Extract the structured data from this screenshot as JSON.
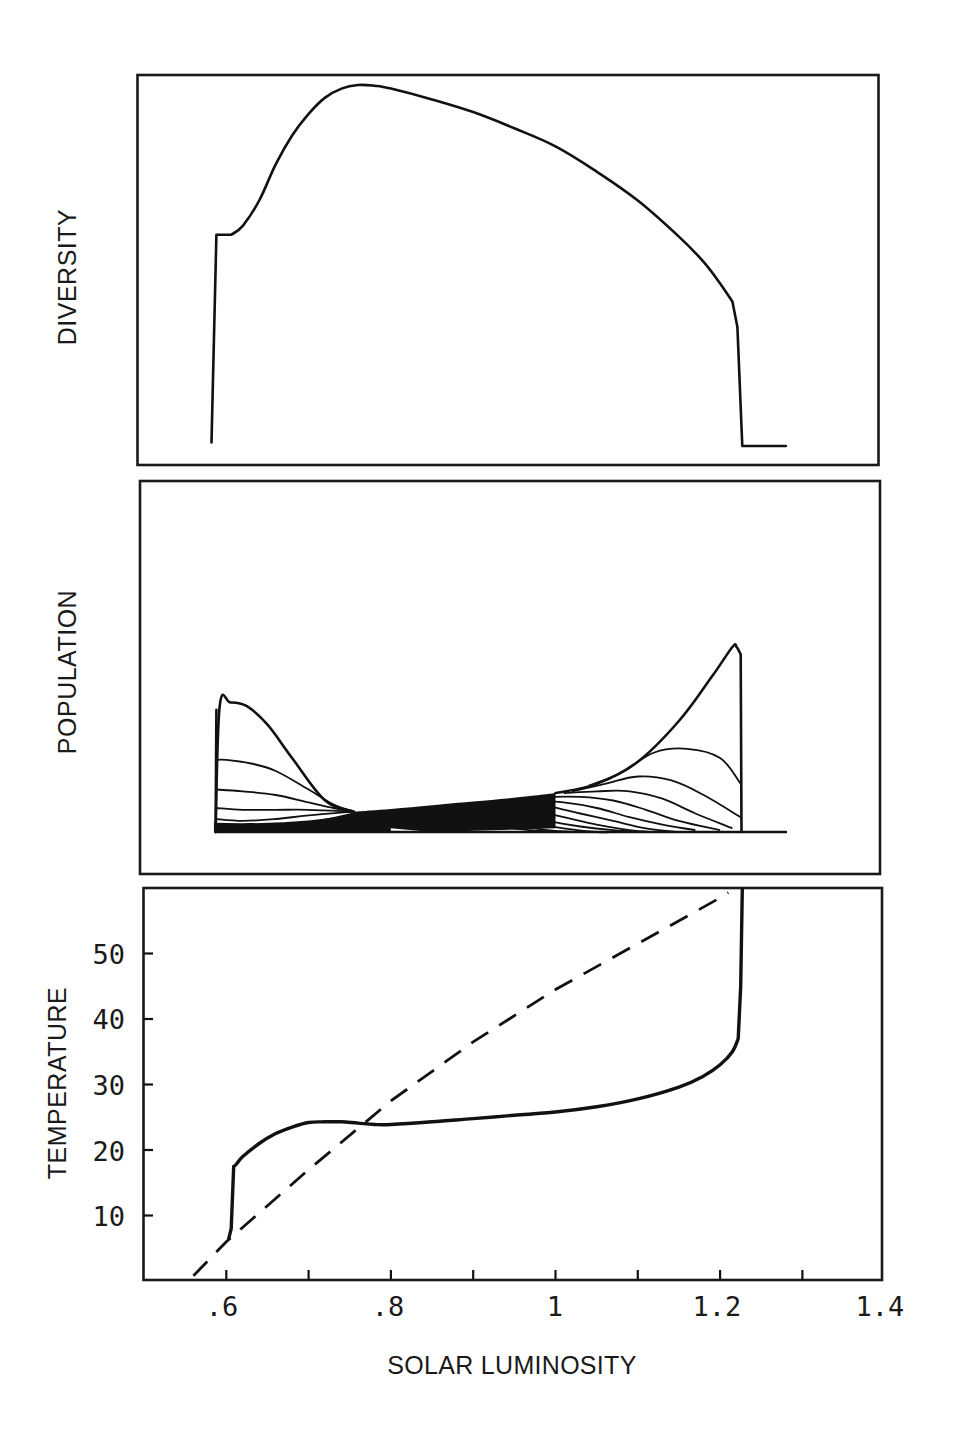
{
  "figure": {
    "panels": [
      {
        "id": "diversity",
        "ylabel": "DIVERSITY"
      },
      {
        "id": "population",
        "ylabel": "POPULATION"
      },
      {
        "id": "temperature",
        "ylabel": "TEMPERATURE"
      }
    ],
    "xlabel": "SOLAR LUMINOSITY",
    "x_tick_labels": [
      ".6",
      ".8",
      "1",
      "1.2",
      "1.4"
    ],
    "y_tick_labels": [
      "10",
      "20",
      "30",
      "40",
      "50"
    ]
  },
  "chart_data": [
    {
      "type": "line",
      "title": "",
      "xlabel": "",
      "ylabel": "DIVERSITY",
      "xlim": [
        0.5,
        1.4
      ],
      "ylim": [
        0,
        1.05
      ],
      "grid": false,
      "y_ticks": false,
      "series": [
        {
          "name": "diversity",
          "style": "solid",
          "x": [
            0.582,
            0.588,
            0.606,
            0.62,
            0.64,
            0.66,
            0.68,
            0.7,
            0.72,
            0.74,
            0.76,
            0.78,
            0.8,
            0.85,
            0.9,
            0.95,
            1.0,
            1.05,
            1.1,
            1.15,
            1.18,
            1.2,
            1.215,
            1.221,
            1.227,
            1.28
          ],
          "y": [
            0.01,
            0.585,
            0.585,
            0.61,
            0.68,
            0.78,
            0.86,
            0.92,
            0.965,
            0.99,
            1.0,
            0.998,
            0.99,
            0.96,
            0.925,
            0.88,
            0.83,
            0.76,
            0.68,
            0.58,
            0.51,
            0.45,
            0.4,
            0.33,
            0.0,
            0.0
          ]
        }
      ]
    },
    {
      "type": "line",
      "title": "",
      "xlabel": "",
      "ylabel": "POPULATION",
      "xlim": [
        0.5,
        1.4
      ],
      "ylim": [
        0,
        1.1
      ],
      "grid": false,
      "y_ticks": false,
      "note": "Family of ~20 daisy-species population curves; species adapted to cold peak at low luminosity, species adapted to warm peak at high luminosity",
      "left_family": {
        "x_start": 0.587,
        "x_converge": 0.755,
        "curves": [
          {
            "x": [
              0.587,
              0.592,
              0.605,
              0.625,
              0.65,
              0.68,
              0.72,
              0.755
            ],
            "y": [
              0.0,
              0.68,
              0.7,
              0.68,
              0.58,
              0.4,
              0.17,
              0.11
            ]
          },
          {
            "x": [
              0.587,
              0.6,
              0.63,
              0.66,
              0.7,
              0.73,
              0.755
            ],
            "y": [
              0.39,
              0.39,
              0.37,
              0.33,
              0.23,
              0.15,
              0.11
            ]
          },
          {
            "x": [
              0.587,
              0.62,
              0.66,
              0.7,
              0.73,
              0.755
            ],
            "y": [
              0.23,
              0.22,
              0.2,
              0.16,
              0.13,
              0.11
            ]
          },
          {
            "x": [
              0.587,
              0.62,
              0.66,
              0.7,
              0.755
            ],
            "y": [
              0.13,
              0.12,
              0.12,
              0.12,
              0.11
            ]
          },
          {
            "x": [
              0.587,
              0.62,
              0.66,
              0.7,
              0.755
            ],
            "y": [
              0.07,
              0.06,
              0.07,
              0.09,
              0.11
            ]
          },
          {
            "x": [
              0.587,
              0.64,
              0.7,
              0.755
            ],
            "y": [
              0.03,
              0.03,
              0.05,
              0.1
            ]
          }
        ]
      },
      "right_family": {
        "x_end": 1.225,
        "curves": [
          {
            "x": [
              1.0,
              1.05,
              1.1,
              1.15,
              1.19,
              1.215,
              1.22,
              1.225,
              1.226
            ],
            "y": [
              0.21,
              0.26,
              0.38,
              0.6,
              0.84,
              1.0,
              1.0,
              0.96,
              0.0
            ]
          },
          {
            "x": [
              1.04,
              1.08,
              1.12,
              1.16,
              1.2,
              1.225
            ],
            "y": [
              0.25,
              0.32,
              0.43,
              0.45,
              0.4,
              0.26
            ]
          },
          {
            "x": [
              1.02,
              1.06,
              1.1,
              1.14,
              1.18,
              1.225
            ],
            "y": [
              0.22,
              0.26,
              0.3,
              0.28,
              0.2,
              0.08
            ]
          },
          {
            "x": [
              1.01,
              1.05,
              1.09,
              1.13,
              1.17,
              1.215
            ],
            "y": [
              0.21,
              0.22,
              0.22,
              0.18,
              0.1,
              0.02
            ]
          },
          {
            "x": [
              0.99,
              1.03,
              1.07,
              1.11,
              1.15,
              1.2
            ],
            "y": [
              0.19,
              0.19,
              0.17,
              0.12,
              0.06,
              0.01
            ]
          },
          {
            "x": [
              0.97,
              1.01,
              1.05,
              1.09,
              1.13,
              1.17
            ],
            "y": [
              0.17,
              0.16,
              0.13,
              0.08,
              0.04,
              0.01
            ]
          },
          {
            "x": [
              0.95,
              0.99,
              1.03,
              1.07,
              1.11,
              1.15
            ],
            "y": [
              0.16,
              0.14,
              0.1,
              0.06,
              0.02,
              0.0
            ]
          },
          {
            "x": [
              0.93,
              0.97,
              1.01,
              1.05,
              1.09,
              1.12
            ],
            "y": [
              0.15,
              0.12,
              0.08,
              0.04,
              0.01,
              0.0
            ]
          },
          {
            "x": [
              0.91,
              0.95,
              0.99,
              1.03,
              1.07,
              1.1
            ],
            "y": [
              0.14,
              0.1,
              0.06,
              0.03,
              0.01,
              0.0
            ]
          },
          {
            "x": [
              0.89,
              0.93,
              0.97,
              1.01,
              1.05,
              1.07
            ],
            "y": [
              0.13,
              0.09,
              0.05,
              0.02,
              0.0,
              0.0
            ]
          },
          {
            "x": [
              0.87,
              0.91,
              0.95,
              0.99,
              1.03
            ],
            "y": [
              0.12,
              0.08,
              0.04,
              0.01,
              0.0
            ]
          },
          {
            "x": [
              0.85,
              0.89,
              0.93,
              0.97,
              1.0
            ],
            "y": [
              0.11,
              0.07,
              0.03,
              0.01,
              0.0
            ]
          }
        ]
      },
      "middle_band": {
        "top_x": [
          0.755,
          0.8,
          0.85,
          0.9,
          0.95,
          1.0
        ],
        "top_y": [
          0.11,
          0.125,
          0.145,
          0.165,
          0.185,
          0.21
        ],
        "bottom_x": [
          0.755,
          0.8,
          0.85,
          1.28
        ],
        "bottom_y": [
          0.07,
          0.02,
          0.0,
          0.0
        ]
      },
      "baseline": {
        "x": [
          0.587,
          1.28
        ],
        "y": [
          0.0,
          0.0
        ]
      }
    },
    {
      "type": "line",
      "title": "",
      "xlabel": "SOLAR LUMINOSITY",
      "ylabel": "TEMPERATURE",
      "xlim": [
        0.5,
        1.4
      ],
      "ylim": [
        0,
        60
      ],
      "grid": false,
      "x_ticks": [
        0.6,
        0.7,
        0.8,
        0.9,
        1.0,
        1.1,
        1.2,
        1.3
      ],
      "x_tick_labels": [
        ".6",
        ".8",
        "1",
        "1.2",
        "1.4"
      ],
      "y_ticks": [
        10,
        20,
        30,
        40,
        50
      ],
      "series": [
        {
          "name": "temperature with daisies",
          "style": "solid",
          "x": [
            0.603,
            0.606,
            0.609,
            0.612,
            0.62,
            0.64,
            0.66,
            0.68,
            0.7,
            0.72,
            0.74,
            0.76,
            0.78,
            0.8,
            0.85,
            0.9,
            0.95,
            1.0,
            1.05,
            1.1,
            1.15,
            1.18,
            1.2,
            1.215,
            1.222,
            1.225,
            1.227
          ],
          "y": [
            6.5,
            8.0,
            17.5,
            17.8,
            19.0,
            21.0,
            22.5,
            23.5,
            24.2,
            24.3,
            24.3,
            24.1,
            23.9,
            23.9,
            24.3,
            24.8,
            25.3,
            25.8,
            26.6,
            27.8,
            29.6,
            31.3,
            33.0,
            35.0,
            37.0,
            45.0,
            60.0
          ]
        },
        {
          "name": "temperature without life",
          "style": "dashed",
          "x": [
            0.56,
            0.6,
            0.7,
            0.8,
            0.9,
            1.0,
            1.1,
            1.2,
            1.21
          ],
          "y": [
            0.8,
            6.0,
            17.0,
            27.5,
            36.5,
            44.5,
            51.5,
            58.5,
            59.3
          ]
        }
      ]
    }
  ]
}
